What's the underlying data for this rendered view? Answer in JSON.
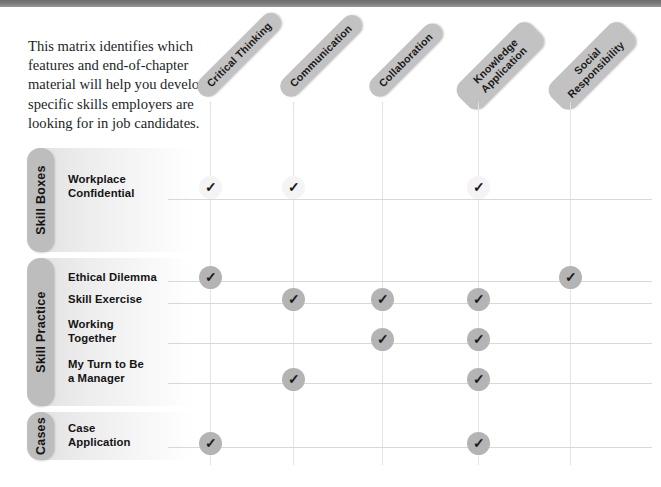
{
  "intro": {
    "text": "This matrix identifies which features and end-of-chapter material will help you develop specific skills employers are looking for in job candidates."
  },
  "colors": {
    "header_pill": "#c2c2c2",
    "group_pill": "#bdbdbd",
    "check_solid": "#b4b4b4",
    "check_faint": "#f4f4f4",
    "gridline": "#d8d8d8",
    "top_rule": "#7d7d7d"
  },
  "columns": [
    {
      "id": "critical-thinking",
      "label": "Critical Thinking",
      "lines": [
        "Critical Thinking"
      ],
      "x": 210
    },
    {
      "id": "communication",
      "label": "Communication",
      "lines": [
        "Communication"
      ],
      "x": 293
    },
    {
      "id": "collaboration",
      "label": "Collaboration",
      "lines": [
        "Collaboration"
      ],
      "x": 382
    },
    {
      "id": "knowledge-application",
      "label": "Knowledge Application",
      "lines": [
        "Knowledge",
        "Application"
      ],
      "x": 478
    },
    {
      "id": "social-responsibility",
      "label": "Social Responsibility",
      "lines": [
        "Social",
        "Responsibility"
      ],
      "x": 570
    }
  ],
  "groups": [
    {
      "id": "skill-boxes",
      "label": "Skill Boxes",
      "top": 148,
      "height": 104
    },
    {
      "id": "skill-practice",
      "label": "Skill Practice",
      "top": 258,
      "height": 148
    },
    {
      "id": "cases",
      "label": "Cases",
      "top": 412,
      "height": 48
    }
  ],
  "rows": [
    {
      "id": "workplace-confidential",
      "group": "skill-boxes",
      "label": "Workplace\nConfidential",
      "label_top": 172,
      "line_y": 199,
      "check_y": 176,
      "check_style": "faint",
      "marks": [
        true,
        true,
        false,
        true,
        false
      ]
    },
    {
      "id": "ethical-dilemma",
      "group": "skill-practice",
      "label": "Ethical Dilemma",
      "label_top": 270,
      "line_y": 281,
      "check_y": 266,
      "check_style": "solid",
      "marks": [
        true,
        false,
        false,
        false,
        true
      ]
    },
    {
      "id": "skill-exercise",
      "group": "skill-practice",
      "label": "Skill Exercise",
      "label_top": 292,
      "line_y": 303,
      "check_y": 288,
      "check_style": "solid",
      "marks": [
        false,
        true,
        true,
        true,
        false
      ]
    },
    {
      "id": "working-together",
      "group": "skill-practice",
      "label": "Working\nTogether",
      "label_top": 317,
      "line_y": 343,
      "check_y": 328,
      "check_style": "solid",
      "marks": [
        false,
        false,
        true,
        true,
        false
      ]
    },
    {
      "id": "my-turn-to-be-a-manager",
      "group": "skill-practice",
      "label": "My Turn to Be\na Manager",
      "label_top": 357,
      "line_y": 383,
      "check_y": 368,
      "check_style": "solid",
      "marks": [
        false,
        true,
        false,
        true,
        false
      ]
    },
    {
      "id": "case-application",
      "group": "cases",
      "label": "Case\nApplication",
      "label_top": 421,
      "line_y": 447,
      "check_y": 432,
      "check_style": "solid",
      "marks": [
        true,
        false,
        false,
        true,
        false
      ]
    }
  ],
  "check_glyph": "✓",
  "geometry": {
    "grid_left": 168,
    "grid_right": 652,
    "vline_top": 105,
    "vline_bottom": 465,
    "label_left": 68,
    "header_baseline_y": 108
  }
}
